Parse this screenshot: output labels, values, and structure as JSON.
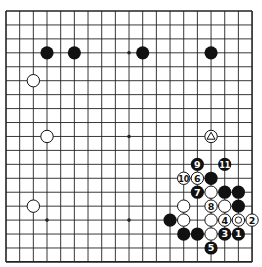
{
  "board": {
    "size": 19,
    "origin": {
      "x": 6,
      "y": 11
    },
    "spacing": {
      "x": 13.67,
      "y": 13.94
    },
    "line_color": "#222222",
    "black_color": "#111111",
    "white_color": "#ffffff",
    "star_points": [
      [
        3,
        3
      ],
      [
        9,
        3
      ],
      [
        15,
        3
      ],
      [
        3,
        9
      ],
      [
        9,
        9
      ],
      [
        15,
        9
      ],
      [
        3,
        15
      ],
      [
        9,
        15
      ],
      [
        15,
        15
      ]
    ],
    "stones": [
      {
        "color": "black",
        "col": 3,
        "row": 3
      },
      {
        "color": "black",
        "col": 5,
        "row": 3
      },
      {
        "color": "black",
        "col": 10,
        "row": 3
      },
      {
        "color": "black",
        "col": 15,
        "row": 3
      },
      {
        "color": "white",
        "col": 2,
        "row": 5
      },
      {
        "color": "white",
        "col": 3,
        "row": 9
      },
      {
        "color": "white",
        "col": 2,
        "row": 14
      },
      {
        "color": "white",
        "col": 15,
        "row": 9,
        "mark": "triangle"
      },
      {
        "color": "black",
        "col": 14,
        "row": 11,
        "label": "9"
      },
      {
        "color": "black",
        "col": 16,
        "row": 11,
        "label": "11"
      },
      {
        "color": "white",
        "col": 13,
        "row": 12,
        "label": "10"
      },
      {
        "color": "white",
        "col": 14,
        "row": 12,
        "label": "6"
      },
      {
        "color": "black",
        "col": 15,
        "row": 12
      },
      {
        "color": "black",
        "col": 14,
        "row": 13,
        "label": "7"
      },
      {
        "color": "white",
        "col": 15,
        "row": 13
      },
      {
        "color": "black",
        "col": 16,
        "row": 13
      },
      {
        "color": "black",
        "col": 17,
        "row": 13
      },
      {
        "color": "white",
        "col": 13,
        "row": 14
      },
      {
        "color": "white",
        "col": 15,
        "row": 14,
        "label": "8"
      },
      {
        "color": "white",
        "col": 16,
        "row": 14
      },
      {
        "color": "black",
        "col": 17,
        "row": 14
      },
      {
        "color": "black",
        "col": 12,
        "row": 15
      },
      {
        "color": "white",
        "col": 13,
        "row": 15
      },
      {
        "color": "white",
        "col": 15,
        "row": 15
      },
      {
        "color": "white",
        "col": 16,
        "row": 15,
        "label": "4"
      },
      {
        "color": "white",
        "col": 17,
        "row": 15,
        "mark": "circle"
      },
      {
        "color": "white",
        "col": 18,
        "row": 15,
        "label": "2"
      },
      {
        "color": "black",
        "col": 13,
        "row": 16
      },
      {
        "color": "black",
        "col": 14,
        "row": 16
      },
      {
        "color": "white",
        "col": 15,
        "row": 16
      },
      {
        "color": "black",
        "col": 16,
        "row": 16,
        "label": "3"
      },
      {
        "color": "black",
        "col": 17,
        "row": 16,
        "label": "1"
      },
      {
        "color": "black",
        "col": 15,
        "row": 17,
        "label": "5"
      }
    ]
  }
}
